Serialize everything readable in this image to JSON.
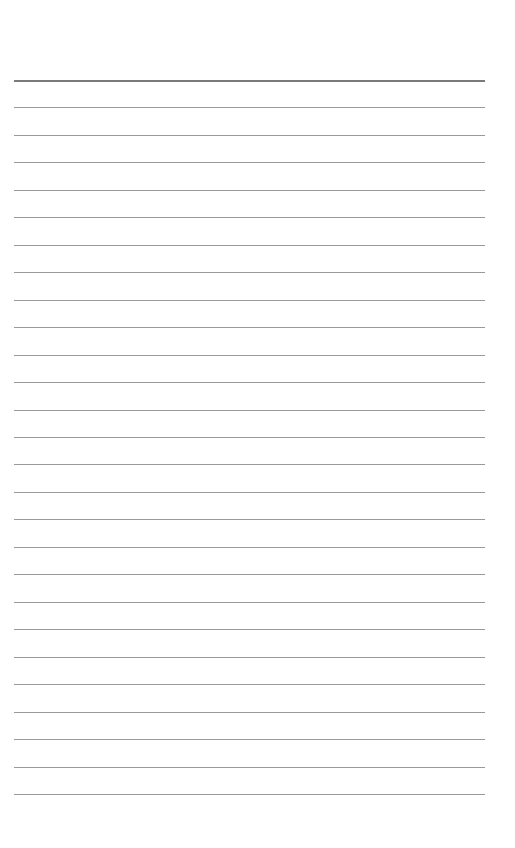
{
  "page": {
    "type": "lined-paper",
    "line_count": 27,
    "first_line_y": 80,
    "line_spacing": 27.46,
    "line_color": "#9a9a9a",
    "top_line_color": "#7a7a7a"
  }
}
